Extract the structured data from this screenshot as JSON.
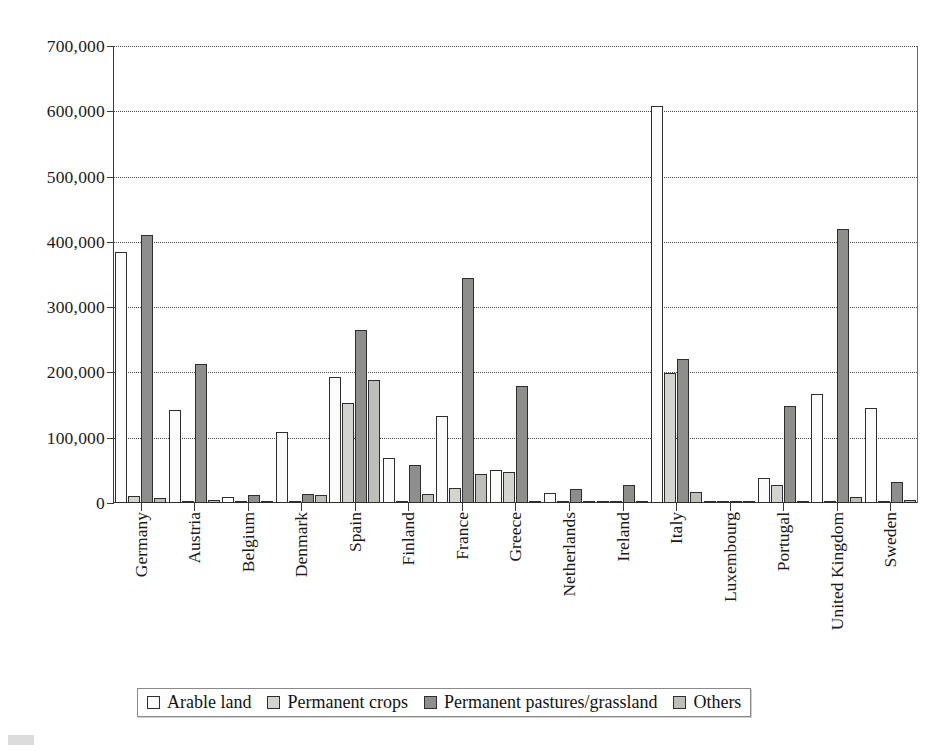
{
  "chart_data": {
    "type": "bar",
    "title": "",
    "subtitle": "",
    "xlabel": "",
    "ylabel": "",
    "ylim": [
      0,
      700000
    ],
    "ytick_labels": [
      "700,000",
      "600,000",
      "500,000",
      "400,000",
      "300,000",
      "200,000",
      "100,000",
      "0"
    ],
    "ytick_values": [
      700000,
      600000,
      500000,
      400000,
      300000,
      200000,
      100000,
      0
    ],
    "grid": true,
    "legend_position": "bottom",
    "categories": [
      "Germany",
      "Austria",
      "Belgium",
      "Denmark",
      "Spain",
      "Finland",
      "France",
      "Greece",
      "Netherlands",
      "Ireland",
      "Italy",
      "Luxembourg",
      "Portugal",
      "United Kingdom",
      "Sweden"
    ],
    "series": [
      {
        "name": "Arable land",
        "color": "#fbfbfb",
        "values": [
          385000,
          142000,
          9000,
          109000,
          193000,
          69000,
          134000,
          50000,
          16000,
          2000,
          608000,
          1000,
          38000,
          167000,
          146000
        ]
      },
      {
        "name": "Permanent crops",
        "color": "#d3d3d0",
        "values": [
          10000,
          1000,
          1000,
          1000,
          153000,
          2000,
          23000,
          47000,
          1000,
          500,
          199000,
          500,
          28000,
          2000,
          1000
        ]
      },
      {
        "name": "Permanent pastures/grassland",
        "color": "#8e8e8c",
        "values": [
          410000,
          213000,
          12000,
          14000,
          265000,
          58000,
          345000,
          180000,
          22000,
          28000,
          221000,
          2000,
          148000,
          420000,
          32000
        ]
      },
      {
        "name": "Others",
        "color": "#bdbdba",
        "values": [
          7000,
          5000,
          1000,
          12000,
          188000,
          14000,
          45000,
          2000,
          1000,
          1000,
          17000,
          500,
          1000,
          9000,
          5000
        ]
      }
    ]
  },
  "legend": {
    "items": [
      {
        "label": "Arable land",
        "swatch": "s0"
      },
      {
        "label": "Permanent crops",
        "swatch": "s1"
      },
      {
        "label": "Permanent pastures/grassland",
        "swatch": "s2"
      },
      {
        "label": "Others",
        "swatch": "s3"
      }
    ]
  }
}
